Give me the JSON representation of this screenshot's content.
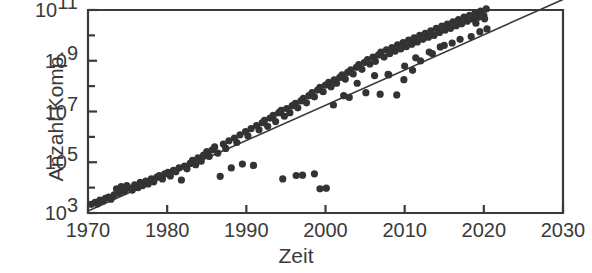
{
  "figure": {
    "background": "#ffffff",
    "ink_color": "#3a3a3a",
    "marker_color": "#333333"
  },
  "labels": {
    "ylabel": "Anzahl Komp.",
    "xlabel": "Zeit"
  },
  "chart_data": {
    "type": "scatter",
    "title": "",
    "xlabel": "Zeit",
    "ylabel": "Anzahl Komp.",
    "xlim": [
      1970,
      2030
    ],
    "ylim": [
      1000,
      100000000000.0
    ],
    "yscale": "log",
    "xscale": "linear",
    "grid": false,
    "legend": null,
    "xticks": [
      1970,
      1980,
      1990,
      2000,
      2010,
      2020,
      2030
    ],
    "xticklabels": [
      "1970",
      "1980",
      "1990",
      "2000",
      "2010",
      "2020",
      "2030"
    ],
    "yticks": [
      1000,
      10000,
      100000,
      1000000,
      10000000,
      100000000,
      1000000000,
      10000000000,
      100000000000
    ],
    "yticklabels": [
      "10^3",
      "",
      "10^5",
      "",
      "10^7",
      "",
      "10^9",
      "",
      "10^11"
    ],
    "ytick_major": [
      1000,
      100000,
      10000000,
      1000000000,
      100000000000
    ],
    "ytick_major_mantissa": "10",
    "ytick_major_exponents": [
      "3",
      "5",
      "7",
      "9",
      "11"
    ],
    "trendline": {
      "type": "linear-fit-on-log",
      "x": [
        1970,
        2030
      ],
      "y": [
        1200,
        260000000000
      ],
      "note": "straight line on semi-log axes from lower-left to upper-right corner"
    },
    "series": [
      {
        "name": "Komponenten pro Chip",
        "marker": "circle",
        "points": [
          [
            1970.4,
            2200
          ],
          [
            1970.9,
            2600
          ],
          [
            1971.2,
            2300
          ],
          [
            1971.5,
            3200
          ],
          [
            1971.9,
            3000
          ],
          [
            1972.2,
            3800
          ],
          [
            1972.6,
            4200
          ],
          [
            1972.9,
            3500
          ],
          [
            1973.3,
            5200
          ],
          [
            1973.6,
            9000
          ],
          [
            1973.9,
            6000
          ],
          [
            1974.2,
            11000
          ],
          [
            1974.6,
            7000
          ],
          [
            1974.9,
            12000
          ],
          [
            1975.2,
            9500
          ],
          [
            1975.6,
            8000
          ],
          [
            1975.9,
            13000
          ],
          [
            1976.3,
            10000
          ],
          [
            1976.6,
            16000
          ],
          [
            1976.9,
            12000
          ],
          [
            1977.3,
            18000
          ],
          [
            1977.6,
            14000
          ],
          [
            1978.0,
            22000
          ],
          [
            1978.3,
            17000
          ],
          [
            1978.7,
            26000
          ],
          [
            1979.0,
            30000
          ],
          [
            1979.4,
            22000
          ],
          [
            1979.7,
            35000
          ],
          [
            1980.1,
            40000
          ],
          [
            1980.4,
            29000
          ],
          [
            1980.8,
            48000
          ],
          [
            1981.1,
            42000
          ],
          [
            1981.5,
            60000
          ],
          [
            1981.8,
            20000
          ],
          [
            1982.2,
            70000
          ],
          [
            1982.5,
            55000
          ],
          [
            1982.9,
            90000
          ],
          [
            1983.2,
            120000
          ],
          [
            1983.6,
            80000
          ],
          [
            1983.9,
            150000
          ],
          [
            1984.3,
            110000
          ],
          [
            1984.6,
            190000
          ],
          [
            1985.0,
            260000
          ],
          [
            1985.3,
            170000
          ],
          [
            1985.7,
            310000
          ],
          [
            1986.0,
            400000
          ],
          [
            1986.4,
            230000
          ],
          [
            1986.7,
            28000
          ],
          [
            1987.1,
            520000
          ],
          [
            1987.4,
            350000
          ],
          [
            1987.8,
            700000
          ],
          [
            1988.1,
            60000
          ],
          [
            1988.5,
            900000
          ],
          [
            1988.8,
            600000
          ],
          [
            1989.2,
            1200000
          ],
          [
            1989.5,
            85000
          ],
          [
            1989.9,
            1600000
          ],
          [
            1990.2,
            1100000
          ],
          [
            1990.6,
            2100000
          ],
          [
            1990.9,
            75000
          ],
          [
            1991.3,
            2800000
          ],
          [
            1991.6,
            1900000
          ],
          [
            1992.0,
            3600000
          ],
          [
            1992.3,
            4500000
          ],
          [
            1992.7,
            2600000
          ],
          [
            1993.0,
            5500000
          ],
          [
            1993.4,
            7000000
          ],
          [
            1993.7,
            4000000
          ],
          [
            1994.1,
            9000000
          ],
          [
            1994.4,
            11000000
          ],
          [
            1994.8,
            6500000
          ],
          [
            1995.1,
            13000000
          ],
          [
            1995.5,
            9000000
          ],
          [
            1995.8,
            17000000
          ],
          [
            1996.2,
            21000000
          ],
          [
            1996.5,
            14000000
          ],
          [
            1996.9,
            26000000
          ],
          [
            1997.2,
            33000000
          ],
          [
            1997.6,
            22000000
          ],
          [
            1997.9,
            42000000
          ],
          [
            1994.6,
            22000
          ],
          [
            1996.3,
            30000
          ],
          [
            1997.1,
            31000
          ],
          [
            1998.6,
            35000
          ],
          [
            1999.3,
            9000
          ],
          [
            2000.1,
            9500
          ],
          [
            1998.3,
            55000000
          ],
          [
            1998.6,
            38000000
          ],
          [
            1999.0,
            70000000
          ],
          [
            1999.3,
            90000000
          ],
          [
            1999.7,
            60000000
          ],
          [
            2000.0,
            110000000
          ],
          [
            2000.4,
            140000000
          ],
          [
            2000.7,
            95000000
          ],
          [
            2001.1,
            175000000
          ],
          [
            2001.4,
            130000000
          ],
          [
            2001.8,
            220000000
          ],
          [
            2002.1,
            280000000
          ],
          [
            2002.5,
            190000000
          ],
          [
            2002.8,
            350000000
          ],
          [
            2003.2,
            440000000
          ],
          [
            2003.5,
            300000000
          ],
          [
            2003.9,
            550000000
          ],
          [
            2004.2,
            700000000
          ],
          [
            2004.6,
            460000000
          ],
          [
            2004.9,
            850000000
          ],
          [
            2005.3,
            1100000000
          ],
          [
            2005.6,
            750000000
          ],
          [
            2006.0,
            1400000000
          ],
          [
            2006.3,
            950000000
          ],
          [
            2006.7,
            1700000000
          ],
          [
            2007.0,
            2200000000
          ],
          [
            2007.4,
            1400000000
          ],
          [
            2007.7,
            2700000000
          ],
          [
            2008.1,
            1900000000
          ],
          [
            2008.4,
            3300000000
          ],
          [
            2008.8,
            2400000000
          ],
          [
            2009.1,
            4200000000
          ],
          [
            2009.5,
            2900000000
          ],
          [
            2009.8,
            5200000000
          ],
          [
            2010.2,
            3600000000
          ],
          [
            2010.5,
            6500000000
          ],
          [
            2010.9,
            4500000000
          ],
          [
            2011.2,
            8000000000
          ],
          [
            2011.6,
            5500000000
          ],
          [
            2011.9,
            10000000000
          ],
          [
            2012.3,
            7000000000
          ],
          [
            2012.6,
            12000000000
          ],
          [
            2013.0,
            8500000000
          ],
          [
            2013.3,
            15000000000
          ],
          [
            2013.7,
            10000000000
          ],
          [
            2014.0,
            19000000000
          ],
          [
            2014.4,
            13000000000
          ],
          [
            2014.7,
            23000000000
          ],
          [
            2015.1,
            16000000000
          ],
          [
            2015.4,
            28000000000
          ],
          [
            2015.8,
            19000000000
          ],
          [
            2016.1,
            34000000000
          ],
          [
            2016.5,
            24000000000
          ],
          [
            2016.8,
            42000000000
          ],
          [
            2017.2,
            29000000000
          ],
          [
            2017.5,
            52000000000
          ],
          [
            2017.9,
            36000000000
          ],
          [
            2018.2,
            62000000000
          ],
          [
            2018.6,
            44000000000
          ],
          [
            2018.9,
            75000000000
          ],
          [
            2019.3,
            52000000000
          ],
          [
            2019.6,
            90000000000
          ],
          [
            2020.0,
            62000000000
          ],
          [
            2020.3,
            110000000000
          ],
          [
            2020.1,
            45000000000
          ],
          [
            2019.0,
            30000000000
          ],
          [
            2006.2,
            260000000
          ],
          [
            2007.9,
            290000000
          ],
          [
            2009.0,
            45000000
          ],
          [
            2011.4,
            1300000000
          ],
          [
            2013.1,
            2200000000
          ],
          [
            2016.0,
            5000000000
          ],
          [
            2018.4,
            9000000000
          ],
          [
            2004.0,
            130000000
          ],
          [
            2002.3,
            42000000
          ],
          [
            2005.1,
            55000000
          ],
          [
            2010.0,
            620000000
          ],
          [
            2012.0,
            980000000
          ],
          [
            2014.5,
            3500000000
          ],
          [
            2017.0,
            7000000000
          ],
          [
            2020.4,
            18000000000
          ],
          [
            2001.0,
            18000000
          ],
          [
            2003.0,
            36000000
          ],
          [
            2008.0,
            280000000
          ],
          [
            2015.0,
            4000000000
          ],
          [
            2019.5,
            14000000000
          ],
          [
            2006.9,
            48000000
          ],
          [
            2013.5,
            1900000000
          ],
          [
            2011.0,
            420000000
          ],
          [
            2009.9,
            180000000
          ]
        ]
      }
    ]
  }
}
